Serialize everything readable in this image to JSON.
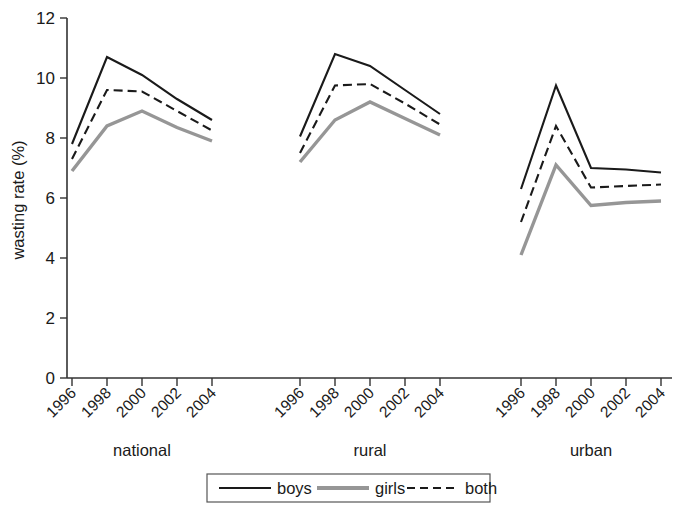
{
  "chart_data": {
    "type": "line",
    "title": "",
    "subtitle": "",
    "xlabel": "",
    "ylabel": "wasting rate (%)",
    "ylim": [
      0,
      12
    ],
    "yticks": [
      0,
      2,
      4,
      6,
      8,
      10,
      12
    ],
    "ytick_labels": [
      "0",
      "2",
      "4",
      "6",
      "8",
      "10",
      "12"
    ],
    "grid": false,
    "legend_position": "bottom",
    "panel_labels": [
      "national",
      "rural",
      "urban"
    ],
    "x": [
      1996,
      1998,
      2000,
      2002,
      2004
    ],
    "xtick_labels": [
      "1996",
      "1998",
      "2000",
      "2002",
      "2004"
    ],
    "series": [
      {
        "name": "boys",
        "color": "#1a1a1a",
        "style": "solid",
        "panels": {
          "national": [
            7.8,
            10.7,
            10.1,
            9.3,
            8.6
          ],
          "rural": [
            8.05,
            10.8,
            10.4,
            9.6,
            8.8
          ],
          "urban": [
            6.3,
            9.75,
            7.0,
            6.95,
            6.85
          ]
        }
      },
      {
        "name": "girls",
        "color": "#969696",
        "style": "solid",
        "panels": {
          "national": [
            6.9,
            8.4,
            8.9,
            8.35,
            7.9
          ],
          "rural": [
            7.2,
            8.6,
            9.2,
            8.65,
            8.1
          ],
          "urban": [
            4.1,
            7.1,
            5.75,
            5.85,
            5.9
          ]
        }
      },
      {
        "name": "both",
        "color": "#1a1a1a",
        "style": "dashed",
        "panels": {
          "national": [
            7.3,
            9.6,
            9.55,
            8.9,
            8.25
          ],
          "rural": [
            7.5,
            9.75,
            9.8,
            9.15,
            8.45
          ],
          "urban": [
            5.2,
            8.4,
            6.35,
            6.4,
            6.45
          ]
        }
      }
    ],
    "legend": [
      {
        "label": "boys",
        "color": "#1a1a1a",
        "style": "solid"
      },
      {
        "label": "girls",
        "color": "#969696",
        "style": "solid"
      },
      {
        "label": "both",
        "color": "#1a1a1a",
        "style": "dashed"
      }
    ]
  }
}
